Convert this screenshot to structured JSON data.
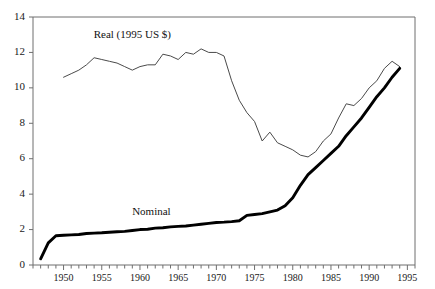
{
  "chart_data": {
    "type": "line",
    "title": "",
    "xlabel": "",
    "ylabel": "",
    "xlim": [
      1946,
      1996
    ],
    "ylim": [
      0,
      14
    ],
    "grid": false,
    "legend_position": "inline-annotation",
    "y_ticks": [
      0,
      2,
      4,
      6,
      8,
      10,
      12,
      14
    ],
    "y_tick_labels": [
      "0",
      "2",
      "4",
      "6",
      "8",
      "10",
      "12",
      "14"
    ],
    "x_ticks": [
      1950,
      1955,
      1960,
      1965,
      1970,
      1975,
      1980,
      1985,
      1990,
      1995
    ],
    "x_tick_labels": [
      "1950",
      "1955",
      "1960",
      "1965",
      "1970",
      "1975",
      "1980",
      "1985",
      "1990",
      "1995"
    ],
    "x_minor_tick_interval": 1,
    "annotations": [
      {
        "text": "Real (1995 US $)",
        "x": 1959.0,
        "y": 12.95
      },
      {
        "text": "Nominal",
        "x": 1961.5,
        "y": 2.95
      }
    ],
    "series": [
      {
        "name": "Real (1995 US $)",
        "label": "Real (1995 US $)",
        "color": "#4a4a4a",
        "linewidth": 1,
        "x": [
          1950,
          1951,
          1952,
          1953,
          1954,
          1955,
          1956,
          1957,
          1958,
          1959,
          1960,
          1961,
          1962,
          1963,
          1964,
          1965,
          1966,
          1967,
          1968,
          1969,
          1970,
          1971,
          1972,
          1973,
          1974,
          1975,
          1976,
          1977,
          1978,
          1979,
          1980,
          1981,
          1982,
          1983,
          1984,
          1985,
          1986,
          1987,
          1988,
          1989,
          1990,
          1991,
          1992,
          1993,
          1994
        ],
        "values": [
          10.6,
          10.8,
          11.0,
          11.3,
          11.7,
          11.6,
          11.5,
          11.4,
          11.2,
          11.0,
          11.2,
          11.3,
          11.3,
          11.9,
          11.8,
          11.6,
          12.0,
          11.9,
          12.2,
          12.0,
          12.0,
          11.8,
          10.4,
          9.3,
          8.6,
          8.1,
          7.0,
          7.5,
          6.9,
          6.7,
          6.5,
          6.2,
          6.1,
          6.4,
          7.0,
          7.4,
          8.3,
          9.1,
          9.0,
          9.4,
          10.0,
          10.4,
          11.1,
          11.5,
          11.2
        ]
      },
      {
        "name": "Nominal",
        "label": "Nominal",
        "color": "#000000",
        "linewidth": 2.9,
        "x": [
          1947,
          1948,
          1949,
          1950,
          1951,
          1952,
          1953,
          1954,
          1955,
          1956,
          1957,
          1958,
          1959,
          1960,
          1961,
          1962,
          1963,
          1964,
          1965,
          1966,
          1967,
          1968,
          1969,
          1970,
          1971,
          1972,
          1973,
          1974,
          1975,
          1976,
          1977,
          1978,
          1979,
          1980,
          1981,
          1982,
          1983,
          1984,
          1985,
          1986,
          1987,
          1988,
          1989,
          1990,
          1991,
          1992,
          1993,
          1994
        ],
        "values": [
          0.35,
          1.25,
          1.65,
          1.68,
          1.7,
          1.72,
          1.78,
          1.8,
          1.82,
          1.85,
          1.88,
          1.9,
          1.95,
          2.0,
          2.02,
          2.08,
          2.1,
          2.15,
          2.18,
          2.2,
          2.25,
          2.3,
          2.35,
          2.4,
          2.42,
          2.45,
          2.5,
          2.8,
          2.85,
          2.9,
          3.0,
          3.1,
          3.35,
          3.8,
          4.5,
          5.1,
          5.5,
          5.9,
          6.3,
          6.7,
          7.3,
          7.8,
          8.3,
          8.9,
          9.5,
          10.0,
          10.6,
          11.1
        ]
      }
    ]
  },
  "plot_area": {
    "left": 33,
    "top": 17,
    "right": 415,
    "bottom": 265
  }
}
